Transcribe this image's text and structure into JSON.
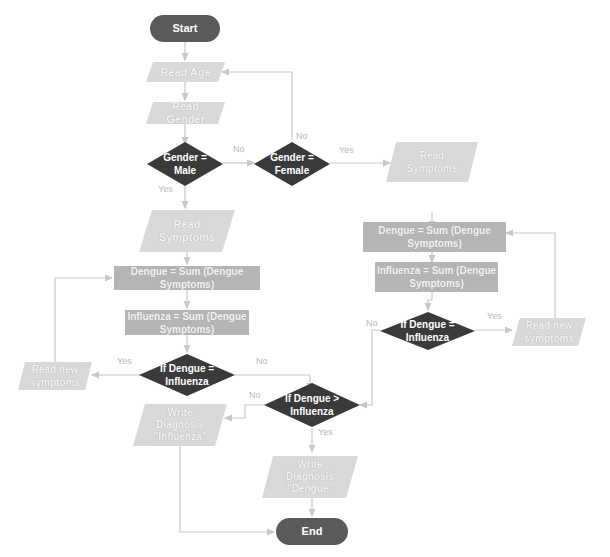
{
  "colors": {
    "terminal": "#5a5a5a",
    "decision": "#3a3a3a",
    "process": "#b5b5b5",
    "io": "#d9d9d9",
    "connector": "#c8c8c8",
    "edge_label": "#b8b8b8"
  },
  "nodes": {
    "start": {
      "label": "Start"
    },
    "read_age": {
      "label": "Read Age"
    },
    "read_gender": {
      "label": "Read\nGender"
    },
    "gender_male": {
      "label": "Gender =\nMale"
    },
    "gender_female": {
      "label": "Gender =\nFemale"
    },
    "read_symptoms_left": {
      "label": "Read\nSymptoms"
    },
    "dengue_sum_left": {
      "label": "Dengue = Sum (Dengue Symptoms)"
    },
    "influenza_sum_left": {
      "label": "Influenza = Sum (Dengue\nSymptoms)"
    },
    "if_equal_left": {
      "label": "If Dengue =\nInfluenza"
    },
    "read_new_left": {
      "label": "Read new\nsymptoms"
    },
    "read_symptoms_right": {
      "label": "Read\nSymptoms"
    },
    "dengue_sum_right": {
      "label": "Dengue = Sum (Dengue Symptoms)"
    },
    "influenza_sum_right": {
      "label": "Influenza = Sum (Dengue\nSymptoms)"
    },
    "if_equal_right": {
      "label": "If Dengue =\nInfluenza"
    },
    "read_new_right": {
      "label": "Read new\nsymptoms"
    },
    "if_greater": {
      "label": "If Dengue >\nInfluenza"
    },
    "write_influenza": {
      "label": "Write\nDiagnosis\n\"Influenza\""
    },
    "write_dengue": {
      "label": "Write\nDiagnosis\n\"Dengue\""
    },
    "end": {
      "label": "End"
    }
  },
  "edge_labels": {
    "male_no": "No",
    "female_no": "No",
    "female_yes": "Yes",
    "male_yes": "Yes",
    "left_eq_yes": "Yes",
    "left_eq_no": "No",
    "right_eq_yes": "Yes",
    "right_eq_no": "No",
    "greater_no": "No",
    "greater_yes": "Yes"
  }
}
